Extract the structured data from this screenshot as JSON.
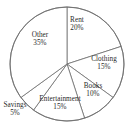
{
  "chart_data": {
    "type": "pie",
    "title": "",
    "subtitle": "",
    "xlabel": "",
    "ylabel": "",
    "legend_position": "none",
    "grid": false,
    "start_angle_deg": 90,
    "direction": "clockwise",
    "units": "percent",
    "total": 100,
    "categories": [
      "Rent",
      "Clothing",
      "Books",
      "Entertainment",
      "Savings",
      "Other"
    ],
    "values": [
      20,
      15,
      10,
      15,
      5,
      35
    ],
    "slices": [
      {
        "name": "Rent",
        "value": 20,
        "value_label": "20%",
        "label_x": 77,
        "label_y": 25,
        "color": "#ffffff",
        "edge_color": "#6e6e6e"
      },
      {
        "name": "Clothing",
        "value": 15,
        "value_label": "15%",
        "label_x": 104,
        "label_y": 64,
        "color": "#ffffff",
        "edge_color": "#6e6e6e"
      },
      {
        "name": "Books",
        "value": 10,
        "value_label": "10%",
        "label_x": 93,
        "label_y": 91,
        "color": "#ffffff",
        "edge_color": "#6e6e6e"
      },
      {
        "name": "Entertainment",
        "value": 15,
        "value_label": "15%",
        "label_x": 60,
        "label_y": 104,
        "color": "#ffffff",
        "edge_color": "#6e6e6e"
      },
      {
        "name": "Savings",
        "value": 5,
        "value_label": "5%",
        "label_x": 15,
        "label_y": 110,
        "color": "#ffffff",
        "edge_color": "#6e6e6e"
      },
      {
        "name": "Other",
        "value": 35,
        "value_label": "35%",
        "label_x": 40,
        "label_y": 40,
        "color": "#ffffff",
        "edge_color": "#6e6e6e"
      }
    ],
    "geometry": {
      "center_x": 67,
      "center_y": 64,
      "radius": 57
    }
  }
}
